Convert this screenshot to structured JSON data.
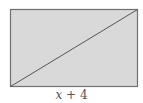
{
  "diagram": {
    "shape": "rectangle",
    "rect": {
      "x": 10,
      "y": 9,
      "width": 127,
      "height": 77
    },
    "diagonal": {
      "from": "bottom-left",
      "to": "top-right"
    },
    "colors": {
      "fill": "#d9d9d9",
      "stroke": "#707070",
      "diagonal": "#555555",
      "label": "#555555"
    },
    "bottom_label": {
      "variable": "x",
      "rest": " + 4"
    }
  }
}
